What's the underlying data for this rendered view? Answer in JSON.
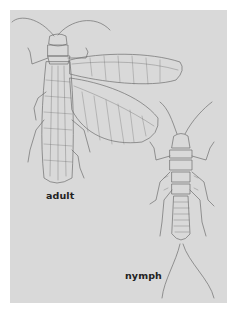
{
  "figure": {
    "background_color": "#d9d9d9",
    "line_color": "#6e6e6e",
    "labels": {
      "adult": "adult",
      "nymph": "nymph"
    },
    "subjects": [
      {
        "name": "adult",
        "description": "winged insect (dobsonfly/stonefly-like) with long antennae and veined wings"
      },
      {
        "name": "nymph",
        "description": "wingless larva with antennae, six legs, segmented abdomen and two long tail filaments"
      }
    ]
  }
}
